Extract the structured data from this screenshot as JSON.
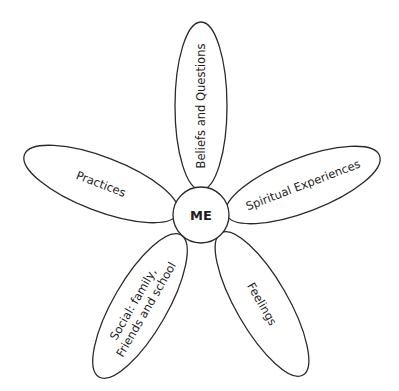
{
  "diagram": {
    "type": "flower-diagram",
    "center": {
      "label": "ME"
    },
    "petals": [
      {
        "id": "beliefs",
        "label_lines": [
          "Beliefs and Questions"
        ]
      },
      {
        "id": "spiritual",
        "label_lines": [
          "Spiritual Experiences"
        ]
      },
      {
        "id": "feelings",
        "label_lines": [
          "Feelings"
        ]
      },
      {
        "id": "social",
        "label_lines": [
          "Social: family,",
          "Friends and school"
        ]
      },
      {
        "id": "practices",
        "label_lines": [
          "Practices"
        ]
      }
    ],
    "colors": {
      "stroke": "#2a2a2a",
      "fill": "#ffffff",
      "text": "#1e1e1e"
    }
  }
}
